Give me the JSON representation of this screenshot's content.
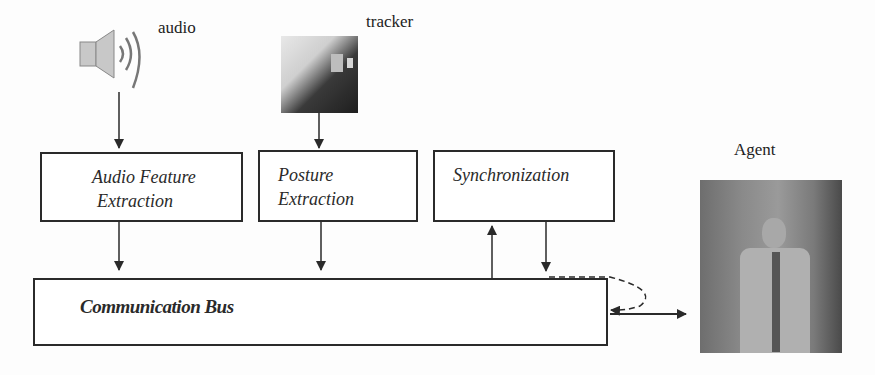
{
  "diagram": {
    "inputs": {
      "audio": {
        "label": "audio",
        "icon": "speaker-icon"
      },
      "tracker": {
        "label": "tracker",
        "icon": "tracker-image"
      }
    },
    "boxes": {
      "audio_feature": {
        "line1": "Audio Feature",
        "line2": "Extraction"
      },
      "posture": {
        "line1": "Posture",
        "line2": "Extraction"
      },
      "sync": {
        "line1": "Synchronization"
      },
      "bus": {
        "label": "Communication Bus"
      }
    },
    "agent": {
      "label": "Agent",
      "icon": "agent-image"
    },
    "colors": {
      "line": "#2a2a2a",
      "background": "#fdfdfd"
    }
  }
}
